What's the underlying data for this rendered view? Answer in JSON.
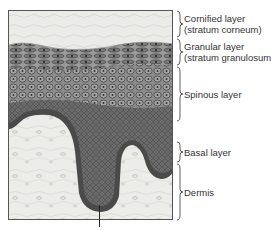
{
  "figure": {
    "colors": {
      "cornified": "#d9d9d9",
      "granular": "#8a8a8a",
      "spinous": "#7a7a7a",
      "basal": "#555555",
      "dermis": "#e9e9e6",
      "outline": "#333333"
    }
  },
  "labels": [
    {
      "line1": "Cornified layer",
      "line2": "(stratum corneum)"
    },
    {
      "line1": "Granular layer",
      "line2": "(stratum granulosum)"
    },
    {
      "line1": "Spinous layer",
      "line2": ""
    },
    {
      "line1": "Basal layer",
      "line2": ""
    },
    {
      "line1": "Dermis",
      "line2": ""
    }
  ]
}
